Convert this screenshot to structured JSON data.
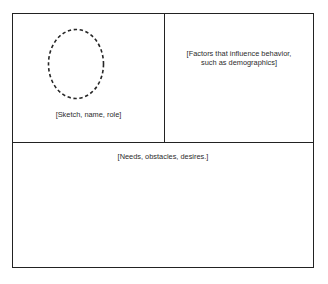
{
  "diagram": {
    "panels": {
      "sketch": {
        "caption": "[Sketch, name, role]",
        "placeholder_shape": "dashed-ellipse"
      },
      "factors": {
        "caption": "[Factors that influence behavior,\nsuch as demographics]"
      },
      "needs": {
        "caption": "[Needs, obstacles, desires.]"
      }
    },
    "colors": {
      "border": "#222222",
      "background": "#ffffff",
      "text": "#2b2b2b",
      "ellipse_stroke": "#262626"
    }
  }
}
